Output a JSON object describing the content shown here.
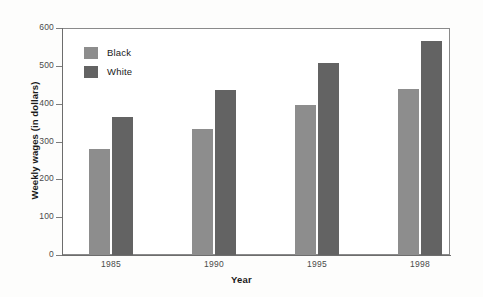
{
  "chart_data": {
    "type": "bar",
    "title": "",
    "xlabel": "Year",
    "ylabel": "Weekly wages (in dollars)",
    "categories": [
      "1985",
      "1990",
      "1995",
      "1998"
    ],
    "series": [
      {
        "name": "Black",
        "color": "#8d8d8d",
        "values": [
          281,
          334,
          396,
          440
        ]
      },
      {
        "name": "White",
        "color": "#636363",
        "values": [
          366,
          437,
          507,
          565
        ]
      }
    ],
    "ylim": [
      0,
      600
    ],
    "yticks": [
      0,
      100,
      200,
      300,
      400,
      500,
      600
    ],
    "ytick_labels": [
      "0",
      "100",
      "200",
      "300",
      "400",
      "500",
      "600"
    ],
    "grid": false,
    "legend_position": "upper-left-inside"
  },
  "legend": {
    "items": [
      {
        "label": "Black",
        "color": "#8d8d8d"
      },
      {
        "label": "White",
        "color": "#636363"
      }
    ]
  }
}
